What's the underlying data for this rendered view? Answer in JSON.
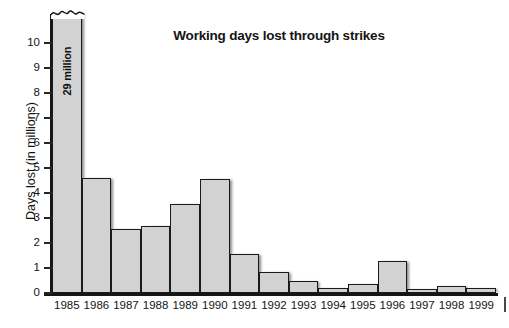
{
  "chart_data": {
    "type": "bar",
    "title": "Working days lost through strikes",
    "xlabel": "",
    "ylabel": "Days lost (in millions)",
    "categories": [
      "1985",
      "1986",
      "1987",
      "1988",
      "1989",
      "1990",
      "1991",
      "1992",
      "1993",
      "1994",
      "1995",
      "1996",
      "1997",
      "1998",
      "1999"
    ],
    "values": [
      29,
      4.6,
      2.55,
      2.7,
      3.55,
      4.55,
      1.55,
      0.85,
      0.48,
      0.2,
      0.38,
      1.3,
      0.17,
      0.28,
      0.22
    ],
    "ylim": [
      0,
      11
    ],
    "yticks": [
      0,
      1,
      2,
      3,
      4,
      5,
      6,
      7,
      8,
      9,
      10
    ],
    "ytick_labels": [
      "0",
      "1",
      "2",
      "3",
      "4",
      "5",
      "6",
      "7",
      "8",
      "9",
      "10"
    ],
    "grid": false,
    "legend": null,
    "annotations": [
      {
        "category": "1985",
        "text": "29 million",
        "note": "bar truncated with wavy axis-break at top"
      }
    ],
    "series": [
      {
        "name": "Working days lost (millions)",
        "values": [
          29,
          4.6,
          2.55,
          2.7,
          3.55,
          4.55,
          1.55,
          0.85,
          0.48,
          0.2,
          0.38,
          1.3,
          0.17,
          0.28,
          0.22
        ]
      }
    ],
    "colors": {
      "bar_fill": "#d2d2d2",
      "bar_edge": "#1a1a1a",
      "axis": "#161616",
      "text": "#141414",
      "background": "#ffffff"
    }
  }
}
